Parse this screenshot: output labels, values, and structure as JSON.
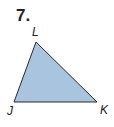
{
  "problem": {
    "number": "7.",
    "figure": "triangle",
    "vertices": [
      {
        "name": "L",
        "x": 36,
        "y": 42
      },
      {
        "name": "J",
        "x": 14,
        "y": 102
      },
      {
        "name": "K",
        "x": 97,
        "y": 102
      }
    ],
    "labels": {
      "L": "L",
      "J": "J",
      "K": "K"
    },
    "fill_color": "#a9c4de",
    "stroke_color": "#2a2a2a"
  }
}
